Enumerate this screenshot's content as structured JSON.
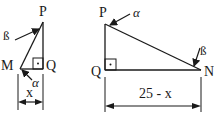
{
  "diagram": {
    "left_triangle": {
      "vertices": {
        "P": "P",
        "M": "M",
        "Q": "Q"
      },
      "angles": {
        "at_P": "ß",
        "at_M": "α"
      },
      "dimension": "x"
    },
    "right_triangle": {
      "vertices": {
        "P": "P",
        "Q": "Q",
        "N": "N"
      },
      "angles": {
        "at_P": "α",
        "at_N": "ß"
      },
      "dimension": "25 - x"
    }
  },
  "colors": {
    "stroke": "#1a1a1a",
    "background": "#ffffff"
  }
}
